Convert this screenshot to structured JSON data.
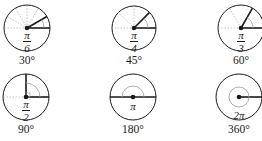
{
  "diagram": {
    "type": "unit-circle-angle-examples",
    "colors": {
      "line": "#1a1a1a",
      "guide": "#9a9a9a"
    },
    "items": [
      {
        "id": "a30",
        "radians_num": "π",
        "radians_den": "6",
        "radians": "π/6",
        "degrees": "30°",
        "angle_deg": 30
      },
      {
        "id": "a45",
        "radians_num": "π",
        "radians_den": "4",
        "radians": "π/4",
        "degrees": "45°",
        "angle_deg": 45
      },
      {
        "id": "a60",
        "radians_num": "π",
        "radians_den": "3",
        "radians": "π/3",
        "degrees": "60°",
        "angle_deg": 60
      },
      {
        "id": "a90",
        "radians_num": "π",
        "radians_den": "2",
        "radians": "π/2",
        "degrees": "90°",
        "angle_deg": 90
      },
      {
        "id": "a180",
        "radians": "π",
        "degrees": "180°",
        "angle_deg": 180
      },
      {
        "id": "a360",
        "radians": "2π",
        "degrees": "360°",
        "angle_deg": 360
      }
    ]
  }
}
